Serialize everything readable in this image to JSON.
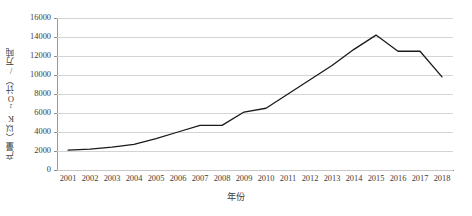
{
  "chart_data": {
    "type": "line",
    "title": "",
    "xlabel": "年份",
    "ylabel": "产量（以K2O计）/万吨",
    "ylabel_display": "产量（以K₂O计）/万吨",
    "categories": [
      "2001",
      "2002",
      "2003",
      "2004",
      "2005",
      "2006",
      "2007",
      "2008",
      "2009",
      "2010",
      "2011",
      "2012",
      "2013",
      "2014",
      "2015",
      "2016",
      "2017",
      "2018"
    ],
    "values": [
      2100,
      2200,
      2400,
      2700,
      3300,
      4000,
      4700,
      4700,
      6100,
      6500,
      8000,
      9500,
      11000,
      12700,
      14200,
      12500,
      12500,
      9800
    ],
    "series": [
      {
        "name": "产量",
        "color": "#1a1a1a",
        "values": [
          2100,
          2200,
          2400,
          2700,
          3300,
          4000,
          4700,
          4700,
          6100,
          6500,
          8000,
          9500,
          11000,
          12700,
          14200,
          12500,
          12500,
          9800
        ]
      }
    ],
    "ylim": [
      0,
      16000
    ],
    "ytick_labels": [
      "0",
      "2000",
      "4000",
      "6000",
      "8000",
      "10000",
      "12000",
      "14000",
      "16000"
    ],
    "ytick_values": [
      0,
      2000,
      4000,
      6000,
      8000,
      10000,
      12000,
      14000,
      16000
    ],
    "grid": true,
    "grid_axis": "y",
    "legend": false,
    "legend_position": "none",
    "markers": false,
    "line_width": 1.3,
    "colors": {
      "line": "#1a1a1a",
      "gridline": "#d4d4d4",
      "axis": "#8e8e8e",
      "text": "#3d3d3d",
      "background": "#ffffff"
    }
  }
}
